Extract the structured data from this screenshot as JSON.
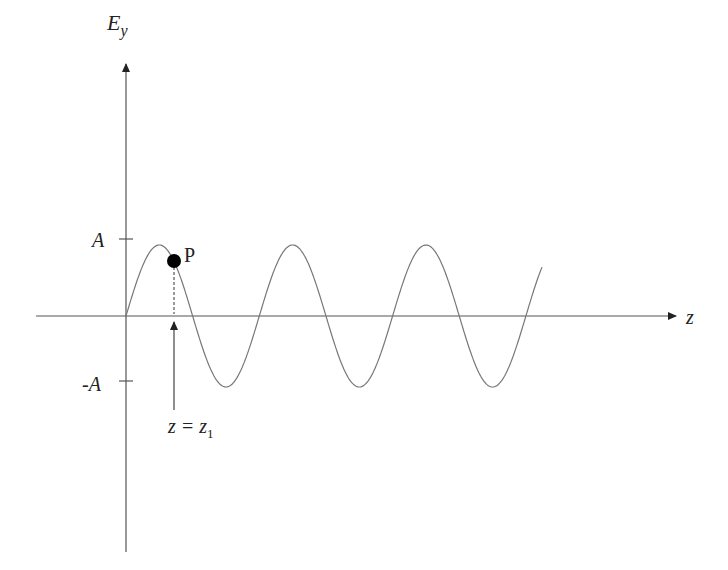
{
  "diagram": {
    "type": "sinusoidal-wave",
    "y_axis": {
      "label_main": "E",
      "label_sub": "y"
    },
    "x_axis": {
      "label": "z"
    },
    "ticks": {
      "positive": "A",
      "negative": "-A"
    },
    "point": {
      "label": "P"
    },
    "annotation": {
      "lhs": "z = z",
      "sub": "1"
    },
    "colors": {
      "axis": "#555555",
      "curve": "#777777",
      "point": "#000000"
    },
    "wave": {
      "amplitude_label": "A",
      "cycles_shown": 3.2,
      "starts_at_origin": true
    }
  }
}
